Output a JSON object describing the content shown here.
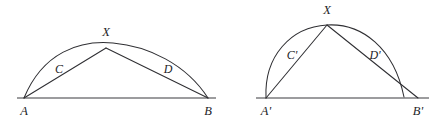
{
  "figure": {
    "caption": "",
    "stroke_color": "#2f2f33",
    "baseline_color": "#3a3a3e",
    "background_color": "#ffffff",
    "label_color": "#232327",
    "panels": [
      {
        "id": "left-panel",
        "name": "flat-arc-figure",
        "vertices": [
          {
            "id": "A",
            "label": "A",
            "x": 24,
            "y": 98
          },
          {
            "id": "B",
            "label": "B",
            "x": 208,
            "y": 98
          },
          {
            "id": "X",
            "label": "X",
            "x": 106,
            "y": 48
          }
        ],
        "vertex_labels": [
          {
            "for": "A",
            "label": "A",
            "x": 24,
            "y": 111
          },
          {
            "for": "B",
            "label": "B",
            "x": 208,
            "y": 111
          },
          {
            "for": "X",
            "label": "X",
            "x": 106,
            "y": 33
          }
        ],
        "arc_labels": [
          {
            "label": "C",
            "x": 59,
            "y": 70
          },
          {
            "label": "D",
            "x": 168,
            "y": 70
          }
        ],
        "baseline": {
          "x1": 17,
          "y1": 98,
          "x2": 216,
          "y2": 98
        },
        "curve": {
          "from": "A",
          "to": "B",
          "apex_x": 140,
          "apex_y": 41
        },
        "chords": [
          {
            "from": "A",
            "to": "X",
            "label": "C"
          },
          {
            "from": "X",
            "to": "B",
            "label": "D"
          }
        ]
      },
      {
        "id": "right-panel",
        "name": "tall-arc-figure",
        "vertices": [
          {
            "id": "A'",
            "label": "A'",
            "x": 266,
            "y": 98
          },
          {
            "id": "B'",
            "label": "B'",
            "x": 418,
            "y": 98
          },
          {
            "id": "X",
            "label": "X",
            "x": 327,
            "y": 25
          }
        ],
        "vertex_labels": [
          {
            "for": "A'",
            "label": "A'",
            "x": 266,
            "y": 111
          },
          {
            "for": "B'",
            "label": "B'",
            "x": 418,
            "y": 111
          },
          {
            "for": "X",
            "label": "X",
            "x": 327,
            "y": 11
          }
        ],
        "arc_labels": [
          {
            "label": "C'",
            "x": 292,
            "y": 56
          },
          {
            "label": "D'",
            "x": 375,
            "y": 56
          }
        ],
        "baseline": {
          "x1": 256,
          "y1": 98,
          "x2": 429,
          "y2": 98
        },
        "curve": {
          "from": "A'",
          "to": "B'",
          "apex_x": 344,
          "apex_y": 23
        },
        "chords": [
          {
            "from": "A'",
            "to": "X",
            "label": "C'"
          },
          {
            "from": "X",
            "to": "B'",
            "label": "D'"
          }
        ]
      }
    ]
  }
}
